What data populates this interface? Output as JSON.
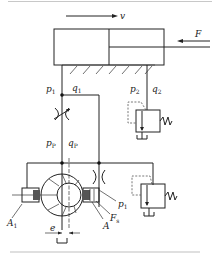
{
  "diagram": {
    "labels": {
      "velocity": "v",
      "force": "F",
      "p1_top": "p",
      "p1_top_sub": "1",
      "q1": "q",
      "q1_sub": "1",
      "p2": "p",
      "p2_sub": "2",
      "q2": "q",
      "q2_sub": "2",
      "pp": "p",
      "pp_sub": "P",
      "qp": "q",
      "qp_sub": "P",
      "p1_pump": "p",
      "p1_pump_sub": "1",
      "A1": "A",
      "A1_sub": "1",
      "A": "A",
      "Fs": "F",
      "Fs_sub": "s",
      "e": "e"
    },
    "components": [
      "hydraulic-cylinder",
      "throttle-valve",
      "fixed-orifice",
      "relief-valve-1",
      "relief-valve-2",
      "variable-vane-pump",
      "control-piston-A1",
      "control-piston-A",
      "tank"
    ]
  }
}
